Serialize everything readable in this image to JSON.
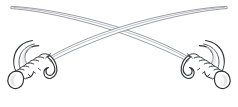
{
  "artwork": {
    "title": "Crossed Sabers",
    "subject": "two crossed cavalry sabers",
    "style": "black and white line art / engraving",
    "orientation": "mirror-symmetric about vertical center",
    "background_color": "#ffffff",
    "canvas": {
      "width": 238,
      "height": 107
    }
  },
  "colors": {
    "background": "#ffffff",
    "outline_dark": "#2f3136",
    "outline_mid": "#42454c",
    "blade_outline": "#6e7380",
    "blade_spine": "#878c98",
    "shadow_fill": "#cfd2d8",
    "shadow_soft": "#e2e4e9"
  },
  "objects": [
    {
      "name": "saber-left",
      "label": "Left saber",
      "blade": {
        "label": "Left saber blade",
        "tip_point": {
          "x": 10,
          "y": 6
        },
        "hilt_point": {
          "x": 196,
          "y": 74
        },
        "direction": "upper-left tip sweeping down to lower-right hilt",
        "curvature": "gentle upward arc",
        "line_count": 2
      },
      "hilt": {
        "label": "Left saber hilt",
        "position": {
          "x": 42,
          "y": 60
        },
        "parts": [
          {
            "name": "knuckle-bow",
            "label": "Knuckle bow guard"
          },
          {
            "name": "grip",
            "label": "Ribbed wire-wrapped grip",
            "rib_count": 6
          },
          {
            "name": "quillon",
            "label": "Curled quillon hook"
          },
          {
            "name": "pommel",
            "label": "Pommel cap"
          }
        ]
      }
    },
    {
      "name": "saber-right",
      "label": "Right saber",
      "blade": {
        "label": "Right saber blade",
        "tip_point": {
          "x": 228,
          "y": 6
        },
        "hilt_point": {
          "x": 42,
          "y": 74
        },
        "direction": "upper-right tip sweeping down to lower-left hilt",
        "curvature": "gentle upward arc",
        "line_count": 2
      },
      "hilt": {
        "label": "Right saber hilt",
        "position": {
          "x": 196,
          "y": 60
        },
        "parts": [
          {
            "name": "knuckle-bow",
            "label": "Knuckle bow guard"
          },
          {
            "name": "grip",
            "label": "Ribbed wire-wrapped grip",
            "rib_count": 6
          },
          {
            "name": "quillon",
            "label": "Curled quillon hook"
          },
          {
            "name": "pommel",
            "label": "Pommel cap"
          }
        ]
      }
    }
  ],
  "crossing": {
    "name": "blade-crossing",
    "label": "Blade crossing point",
    "point": {
      "x": 119,
      "y": 30
    }
  }
}
